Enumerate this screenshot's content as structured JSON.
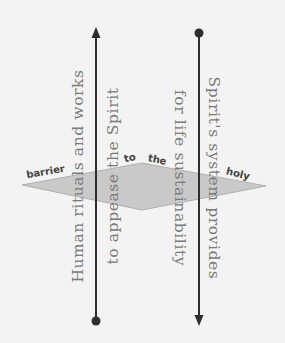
{
  "diagram": {
    "colors": {
      "background": "#f3f3f3",
      "line": "#2e2e2e",
      "text": "#7a7a7a",
      "plane_fill": "#c9c9c9",
      "plane_stroke": "#b0b0b0",
      "barrier_label": "#444444"
    },
    "left_axis": {
      "direction": "upward",
      "start_marker": "dot",
      "end_marker": "arrow",
      "line1": "Human rituals and works",
      "line2": "to appease the Spirit"
    },
    "right_axis": {
      "direction": "downward",
      "start_marker": "dot",
      "end_marker": "arrow",
      "line1": "Spirit's system provides",
      "line2": "for life sustainability"
    },
    "barrier_plane": {
      "words": [
        "barrier",
        "to",
        "the",
        "holy"
      ]
    }
  }
}
